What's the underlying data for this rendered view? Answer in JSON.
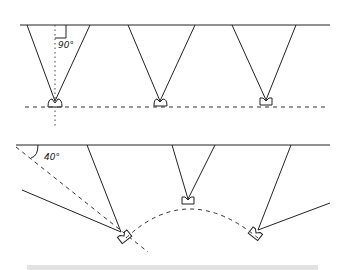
{
  "figure": {
    "top_panel": {
      "description": "Three speakers pointed straight at a flat wall",
      "angle_label": "90°",
      "speaker_count": 3
    },
    "bottom_panel": {
      "description": "Three speakers arranged on an arc, outer speakers angled toward wall",
      "angle_label": "40°",
      "speaker_count": 3
    },
    "colors": {
      "line": "#222222",
      "background": "#ffffff",
      "footer_bar": "#e2e2e2"
    }
  }
}
